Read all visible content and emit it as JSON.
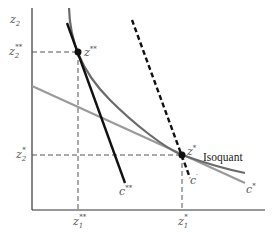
{
  "diagram": {
    "type": "isoquant-cost-minimization",
    "axes": {
      "x_label_base": "z",
      "x_label_sub": "1",
      "y_label_base": "z",
      "y_label_sub": "2"
    },
    "points": {
      "z_double_star": {
        "base": "z",
        "sup": "**"
      },
      "z_star": {
        "base": "z",
        "sup": "*"
      }
    },
    "axis_ticks": {
      "x": [
        {
          "base": "z",
          "sub": "1",
          "sup": "**"
        },
        {
          "base": "z",
          "sub": "1",
          "sup": "*"
        }
      ],
      "y": [
        {
          "base": "z",
          "sub": "2",
          "sup": "**"
        },
        {
          "base": "z",
          "sub": "2",
          "sup": "*"
        }
      ]
    },
    "curves": {
      "isoquant_label": "Isoquant",
      "c_double_star": {
        "base": "c",
        "sup": "**"
      },
      "c_prime": {
        "base": "c",
        "sup": "′"
      },
      "c_star": {
        "base": "c",
        "sup": "*"
      }
    },
    "colors": {
      "axis": "#333333",
      "isoquant": "#6b6b6b",
      "c_star_line": "#9a9a9a",
      "c_double_star_line": "#111111",
      "c_prime_line": "#111111",
      "guide_dashes": "#555555",
      "point": "#111111"
    }
  }
}
